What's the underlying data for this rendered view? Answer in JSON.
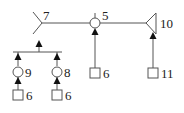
{
  "diagram": {
    "type": "tree",
    "colors": {
      "line": "#555555",
      "arrow": "#111111",
      "text": "#222222",
      "background": "#ffffff"
    },
    "nodes": [
      {
        "id": "fork-7",
        "shape": "fork",
        "label": "7"
      },
      {
        "id": "circle-5",
        "shape": "circle",
        "label": "5"
      },
      {
        "id": "triangle-10",
        "shape": "triangle",
        "label": "10"
      },
      {
        "id": "square-6-mid",
        "shape": "square",
        "label": "6"
      },
      {
        "id": "square-11",
        "shape": "square",
        "label": "11"
      },
      {
        "id": "circle-9",
        "shape": "circle",
        "label": "9"
      },
      {
        "id": "circle-8",
        "shape": "circle",
        "label": "8"
      },
      {
        "id": "square-6-left",
        "shape": "square",
        "label": "6"
      },
      {
        "id": "square-6-right",
        "shape": "square",
        "label": "6"
      }
    ],
    "edges": [
      {
        "from": "fork-7",
        "to": "circle-5",
        "style": "line"
      },
      {
        "from": "circle-5",
        "to": "triangle-10",
        "style": "line"
      },
      {
        "from": "square-6-mid",
        "to": "circle-5",
        "style": "arrow"
      },
      {
        "from": "square-11",
        "to": "triangle-10",
        "style": "arrow"
      },
      {
        "from": "square-6-left",
        "to": "circle-9",
        "style": "arrow"
      },
      {
        "from": "square-6-right",
        "to": "circle-8",
        "style": "arrow"
      },
      {
        "from": "circle-9",
        "to": "junction-bar",
        "style": "arrow"
      },
      {
        "from": "circle-8",
        "to": "junction-bar",
        "style": "arrow"
      },
      {
        "from": "junction-bar",
        "to": "fork-7",
        "style": "arrow"
      }
    ],
    "labels": {
      "n7": "7",
      "n5": "5",
      "n10": "10",
      "n6_mid": "6",
      "n11": "11",
      "n9": "9",
      "n8": "8",
      "n6_left": "6",
      "n6_right": "6"
    }
  }
}
